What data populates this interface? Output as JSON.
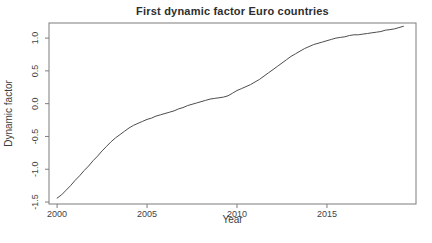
{
  "chart_data": {
    "type": "line",
    "title": "First dynamic factor Euro countries",
    "xlabel": "Year",
    "ylabel": "Dynamic factor",
    "xlim": [
      1999.55,
      2019.95
    ],
    "ylim": [
      -1.53,
      1.23
    ],
    "grid": false,
    "legend": "none",
    "line_color": "#4d4d4d",
    "box_color": "#7d7d7d",
    "tick_text_color": "#434343",
    "xticks": {
      "values": [
        2000,
        2005,
        2010,
        2015
      ],
      "labels": [
        "2000",
        "2005",
        "2010",
        "2015"
      ]
    },
    "yticks": {
      "values": [
        -1.5,
        -1.0,
        -0.5,
        0.0,
        0.5,
        1.0
      ],
      "labels": [
        "-1.5",
        "-1.0",
        "-0.5",
        "0.0",
        "0.5",
        "1.0"
      ]
    },
    "series": [
      {
        "name": "first-dynamic-factor",
        "x": [
          2000.0,
          2000.25,
          2000.5,
          2000.75,
          2001.0,
          2001.25,
          2001.5,
          2001.75,
          2002.0,
          2002.25,
          2002.5,
          2002.75,
          2003.0,
          2003.25,
          2003.5,
          2003.75,
          2004.0,
          2004.25,
          2004.5,
          2004.75,
          2005.0,
          2005.25,
          2005.5,
          2005.75,
          2006.0,
          2006.25,
          2006.5,
          2006.75,
          2007.0,
          2007.25,
          2007.5,
          2007.75,
          2008.0,
          2008.25,
          2008.5,
          2008.75,
          2009.0,
          2009.25,
          2009.5,
          2009.75,
          2010.0,
          2010.25,
          2010.5,
          2010.75,
          2011.0,
          2011.25,
          2011.5,
          2011.75,
          2012.0,
          2012.25,
          2012.5,
          2012.75,
          2013.0,
          2013.25,
          2013.5,
          2013.75,
          2014.0,
          2014.25,
          2014.5,
          2014.75,
          2015.0,
          2015.25,
          2015.5,
          2015.75,
          2016.0,
          2016.25,
          2016.5,
          2016.75,
          2017.0,
          2017.25,
          2017.5,
          2017.75,
          2018.0,
          2018.25,
          2018.5,
          2018.75,
          2019.0,
          2019.25
        ],
        "y": [
          -1.44,
          -1.39,
          -1.32,
          -1.25,
          -1.17,
          -1.1,
          -1.02,
          -0.95,
          -0.87,
          -0.8,
          -0.72,
          -0.65,
          -0.58,
          -0.52,
          -0.47,
          -0.42,
          -0.37,
          -0.33,
          -0.3,
          -0.27,
          -0.24,
          -0.22,
          -0.19,
          -0.17,
          -0.15,
          -0.13,
          -0.11,
          -0.08,
          -0.06,
          -0.03,
          -0.01,
          0.01,
          0.03,
          0.05,
          0.07,
          0.08,
          0.09,
          0.1,
          0.12,
          0.16,
          0.2,
          0.23,
          0.26,
          0.29,
          0.33,
          0.37,
          0.42,
          0.47,
          0.52,
          0.57,
          0.62,
          0.67,
          0.72,
          0.76,
          0.8,
          0.84,
          0.87,
          0.9,
          0.92,
          0.94,
          0.96,
          0.98,
          1.0,
          1.01,
          1.02,
          1.04,
          1.05,
          1.05,
          1.06,
          1.07,
          1.08,
          1.09,
          1.1,
          1.12,
          1.13,
          1.14,
          1.16,
          1.18
        ]
      }
    ]
  }
}
